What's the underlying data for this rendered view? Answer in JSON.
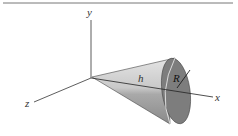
{
  "figure": {
    "axes": {
      "x_label": "x",
      "y_label": "y",
      "z_label": "z"
    },
    "dimensions": {
      "height_label": "h",
      "radius_label": "R"
    },
    "colors": {
      "cone_light": "#d8d8d8",
      "cone_dark": "#8e8e8e",
      "base": "#7a7a7a",
      "axis": "#333333",
      "rule": "#777777"
    }
  }
}
